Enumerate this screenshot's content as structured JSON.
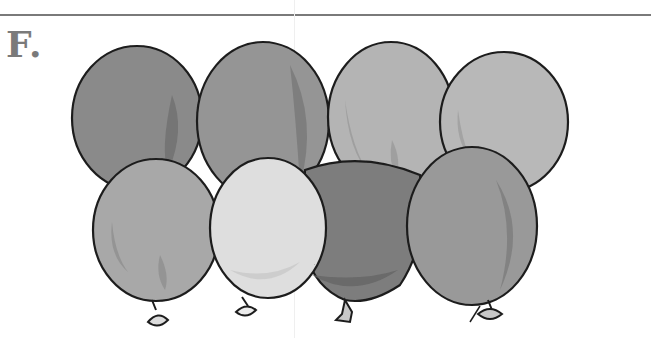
{
  "figure": {
    "label": "F.",
    "balloon_count": 8,
    "rows": [
      {
        "name": "top-row",
        "balloons": [
          {
            "id": 1,
            "fill": "#8a8a8a",
            "shade": "#6f6f6f"
          },
          {
            "id": 2,
            "fill": "#959595",
            "shade": "#777777"
          },
          {
            "id": 3,
            "fill": "#b4b4b4",
            "shade": "#9a9a9a"
          },
          {
            "id": 4,
            "fill": "#b8b8b8",
            "shade": "#9e9e9e"
          }
        ]
      },
      {
        "name": "bottom-row",
        "balloons": [
          {
            "id": 5,
            "fill": "#a8a8a8",
            "shade": "#8e8e8e"
          },
          {
            "id": 6,
            "fill": "#dedede",
            "shade": "#c6c6c6"
          },
          {
            "id": 7,
            "fill": "#7d7d7d",
            "shade": "#656565"
          },
          {
            "id": 8,
            "fill": "#999999",
            "shade": "#7c7c7c"
          }
        ]
      }
    ]
  },
  "colors": {
    "outline": "#1e1e1e",
    "rule": "#7a7a7a",
    "label": "#7a7a7a",
    "background": "#ffffff"
  }
}
